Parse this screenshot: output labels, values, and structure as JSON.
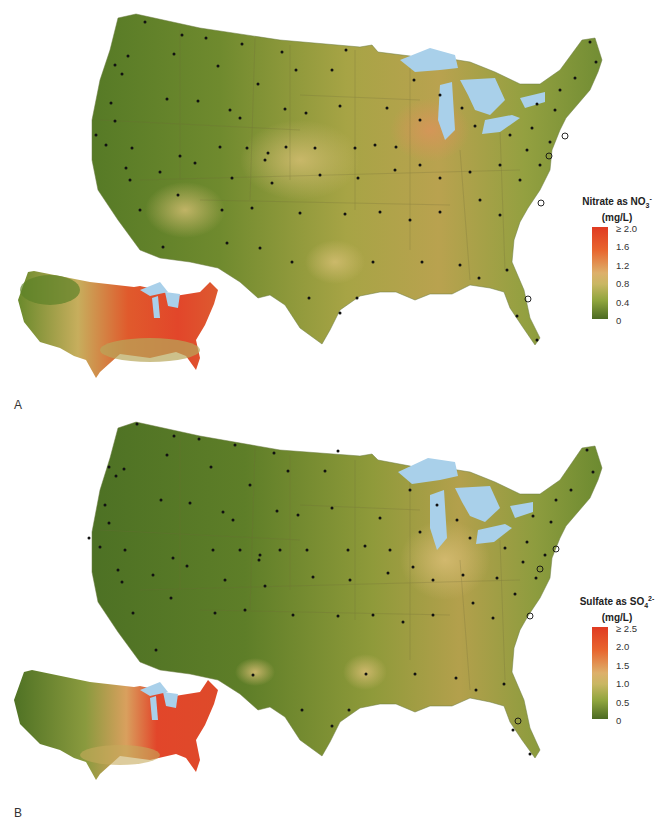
{
  "figure": {
    "panels": [
      {
        "label": "A",
        "variable": "Nitrate",
        "legend": {
          "title_line1": "Nitrate as NO",
          "title_sub": "3",
          "title_sup": "-",
          "title_line2": "(mg/L)",
          "ticks": [
            "≥ 2.0",
            "1.6",
            "1.2",
            "0.8",
            "0.4",
            "0"
          ],
          "colors": [
            "#e03a22",
            "#e8652e",
            "#ddb06a",
            "#c9b763",
            "#8fa53d",
            "#4b6a22"
          ]
        },
        "inset_description": "Inset map of continental US with high values (red) across Midwest and Northeast",
        "sites_marker": "dot",
        "special_sites_marker": "open-circle"
      },
      {
        "label": "B",
        "variable": "Sulfate",
        "legend": {
          "title_line1": "Sulfate as SO",
          "title_sub": "4",
          "title_sup": "2-",
          "title_line2": "(mg/L)",
          "ticks": [
            "≥ 2.5",
            "2.0",
            "1.5",
            "1.0",
            "0.5",
            "0"
          ],
          "colors": [
            "#e03a22",
            "#e8652e",
            "#ddb06a",
            "#c9b763",
            "#8fa53d",
            "#4b6a22"
          ]
        },
        "inset_description": "Inset map of continental US with high values (red) across Ohio Valley and Northeast",
        "sites_marker": "dot",
        "special_sites_marker": "open-circle"
      }
    ],
    "colors": {
      "low": "#4b6a22",
      "mid_low": "#8fa53d",
      "mid": "#c9b763",
      "mid_high": "#dca768",
      "high": "#e03a22",
      "water": "#a9d0ea",
      "background": "#ffffff"
    }
  }
}
